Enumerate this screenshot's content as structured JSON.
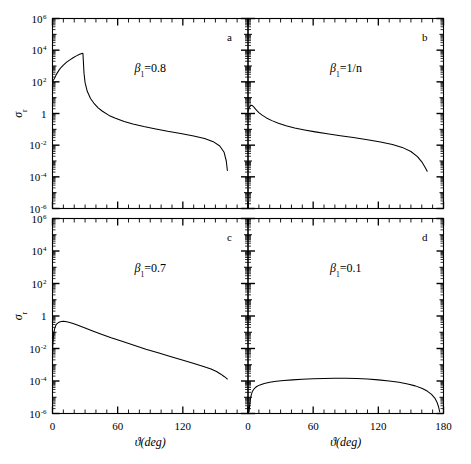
{
  "figure": {
    "xlabel": "ϑ(deg)",
    "ylabel_sigma": "σ",
    "ylabel_sub": "r",
    "x_ticks": [
      "0",
      "60",
      "120",
      "180"
    ],
    "x_tick_values": [
      0,
      60,
      120,
      180
    ],
    "y_ticks": [
      "10",
      "10",
      "10",
      "1",
      "10",
      "10",
      "10"
    ],
    "y_tick_exponents": [
      "6",
      "4",
      "2",
      "",
      "-2",
      "-4",
      "-6"
    ],
    "y_tick_values": [
      6,
      4,
      2,
      0,
      -2,
      -4,
      -6
    ],
    "line_color": "#000000",
    "frame_color": "#000000",
    "background": "#ffffff"
  },
  "chart_data": [
    {
      "type": "line",
      "panel": "a",
      "panel_letter": "a",
      "annotation": "β₁=0.8",
      "annotation_beta": "β",
      "annotation_sub": "1",
      "annotation_rest": "=0.8",
      "xlabel": "ϑ(deg)",
      "ylabel": "σ_r",
      "xlim": [
        0,
        180
      ],
      "ylim": [
        -6,
        6
      ],
      "ylog": true,
      "grid": false,
      "x": [
        0,
        1,
        2,
        4,
        6,
        8,
        10,
        13,
        16,
        19,
        22,
        25,
        27,
        28,
        28.5,
        29,
        30,
        32,
        35,
        38,
        42,
        46,
        52,
        58,
        66,
        74,
        84,
        94,
        106,
        118,
        130,
        140,
        148,
        154,
        158,
        160,
        161
      ],
      "logy": [
        2.05,
        2.12,
        2.25,
        2.52,
        2.74,
        2.92,
        3.06,
        3.24,
        3.39,
        3.52,
        3.64,
        3.74,
        3.79,
        3.8,
        3.2,
        2.55,
        1.95,
        1.4,
        0.95,
        0.66,
        0.36,
        0.14,
        -0.12,
        -0.3,
        -0.5,
        -0.66,
        -0.82,
        -0.96,
        -1.12,
        -1.26,
        -1.42,
        -1.58,
        -1.78,
        -2.05,
        -2.45,
        -3.0,
        -3.6
      ]
    },
    {
      "type": "line",
      "panel": "b",
      "panel_letter": "b",
      "annotation": "β₁=1/n",
      "annotation_beta": "β",
      "annotation_sub": "1",
      "annotation_rest": "=1/n",
      "xlabel": "ϑ(deg)",
      "ylabel": "σ_r",
      "xlim": [
        0,
        180
      ],
      "ylim": [
        -6,
        6
      ],
      "ylog": true,
      "grid": false,
      "x": [
        0,
        1,
        2,
        3,
        4,
        5,
        6,
        8,
        10,
        13,
        17,
        22,
        28,
        35,
        43,
        52,
        62,
        73,
        85,
        97,
        110,
        122,
        133,
        142,
        150,
        156,
        160,
        163,
        165
      ],
      "logy": [
        0.15,
        0.35,
        0.48,
        0.52,
        0.5,
        0.44,
        0.36,
        0.2,
        0.06,
        -0.1,
        -0.28,
        -0.45,
        -0.62,
        -0.78,
        -0.92,
        -1.04,
        -1.16,
        -1.28,
        -1.4,
        -1.52,
        -1.66,
        -1.8,
        -1.96,
        -2.14,
        -2.4,
        -2.72,
        -3.05,
        -3.4,
        -3.65
      ]
    },
    {
      "type": "line",
      "panel": "c",
      "panel_letter": "c",
      "annotation": "β₁=0.7",
      "annotation_beta": "β",
      "annotation_sub": "1",
      "annotation_rest": "=0.7",
      "xlabel": "ϑ(deg)",
      "ylabel": "σ_r",
      "xlim": [
        0,
        180
      ],
      "ylim": [
        -6,
        6
      ],
      "ylog": true,
      "grid": false,
      "x": [
        0,
        0.6,
        1.2,
        2,
        3,
        4,
        6,
        8,
        10,
        12,
        15,
        19,
        24,
        30,
        37,
        45,
        54,
        64,
        75,
        86,
        98,
        110,
        121,
        131,
        139,
        146,
        151,
        155,
        158,
        160,
        161
      ],
      "logy": [
        -2.15,
        -1.5,
        -1.05,
        -0.78,
        -0.58,
        -0.48,
        -0.38,
        -0.34,
        -0.33,
        -0.34,
        -0.38,
        -0.46,
        -0.58,
        -0.74,
        -0.92,
        -1.12,
        -1.34,
        -1.56,
        -1.8,
        -2.04,
        -2.28,
        -2.52,
        -2.74,
        -2.94,
        -3.1,
        -3.26,
        -3.42,
        -3.58,
        -3.72,
        -3.82,
        -3.88
      ]
    },
    {
      "type": "line",
      "panel": "d",
      "panel_letter": "d",
      "annotation": "β₁=0.1",
      "annotation_beta": "β",
      "annotation_sub": "1",
      "annotation_rest": "=0.1",
      "xlabel": "ϑ(deg)",
      "ylabel": "σ_r",
      "xlim": [
        0,
        180
      ],
      "ylim": [
        -6,
        6
      ],
      "ylog": true,
      "grid": false,
      "x": [
        1,
        1.5,
        2,
        3,
        4,
        6,
        8,
        11,
        15,
        20,
        26,
        33,
        41,
        50,
        60,
        70,
        80,
        90,
        100,
        110,
        120,
        130,
        139,
        147,
        154,
        160,
        165,
        169,
        172,
        174,
        175.5,
        176.5
      ],
      "logy": [
        -5.9,
        -5.5,
        -5.2,
        -4.85,
        -4.65,
        -4.45,
        -4.34,
        -4.24,
        -4.15,
        -4.08,
        -4.02,
        -3.97,
        -3.93,
        -3.89,
        -3.86,
        -3.84,
        -3.83,
        -3.83,
        -3.85,
        -3.88,
        -3.93,
        -4.0,
        -4.08,
        -4.18,
        -4.3,
        -4.45,
        -4.62,
        -4.82,
        -5.05,
        -5.3,
        -5.6,
        -5.9
      ]
    }
  ]
}
